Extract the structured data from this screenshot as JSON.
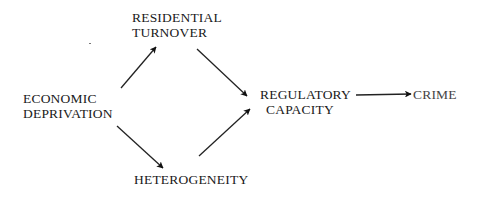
{
  "diagram": {
    "type": "causal-path-diagram",
    "nodes": [
      {
        "id": "economic_deprivation",
        "lines": [
          "ECONOMIC",
          "DEPRIVATION"
        ]
      },
      {
        "id": "residential_turnover",
        "lines": [
          "RESIDENTIAL",
          "TURNOVER"
        ]
      },
      {
        "id": "heterogeneity",
        "lines": [
          "HETEROGENEITY"
        ]
      },
      {
        "id": "regulatory_capacity",
        "lines": [
          "REGULATORY",
          "CAPACITY"
        ]
      },
      {
        "id": "crime",
        "lines": [
          "CRIME"
        ]
      }
    ],
    "edges": [
      {
        "from": "economic_deprivation",
        "to": "residential_turnover"
      },
      {
        "from": "economic_deprivation",
        "to": "heterogeneity"
      },
      {
        "from": "residential_turnover",
        "to": "regulatory_capacity"
      },
      {
        "from": "heterogeneity",
        "to": "regulatory_capacity"
      },
      {
        "from": "regulatory_capacity",
        "to": "crime"
      }
    ],
    "colors": {
      "ink": "#1a1a1a",
      "background": "#ffffff"
    }
  }
}
